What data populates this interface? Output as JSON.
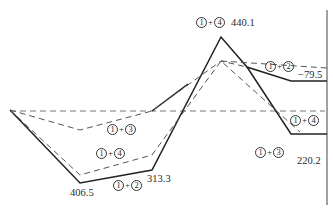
{
  "diagram": {
    "type": "moment-envelope",
    "baseline": {
      "y": 111,
      "x1": 10,
      "x2": 325,
      "style": "dashed"
    },
    "right_support_line": {
      "x": 327,
      "y1": 10,
      "y2": 205
    },
    "solid_paths": [
      {
        "name": "solid-upper",
        "points": "10,110 80,183 152,170 221,37 247,67 291,81 327,81"
      },
      {
        "name": "solid-lower",
        "points": "152,111 188,84"
      },
      {
        "name": "solid-right-drop",
        "points": "247,67 291,134 327,134"
      }
    ],
    "dashed_paths": [
      {
        "name": "dashed-combo-1-3",
        "points": "10,110 80,130 152,111 221,61 247,67"
      },
      {
        "name": "dashed-combo-1-4",
        "points": "10,110 80,175 152,155 221,61 300,132"
      },
      {
        "name": "dashed-peak-right",
        "points": "221,61 327,68"
      }
    ],
    "values": {
      "v1": "440.1",
      "v2": "−79.5",
      "v3": "406.5",
      "v4": "313.3",
      "v5": "220.2"
    },
    "combos": {
      "c14_top": {
        "a": "1",
        "b": "4"
      },
      "c12_right": {
        "a": "1",
        "b": "2"
      },
      "c13_left": {
        "a": "1",
        "b": "3"
      },
      "c14_left": {
        "a": "1",
        "b": "4"
      },
      "c12_bottom": {
        "a": "1",
        "b": "2"
      },
      "c14_right": {
        "a": "1",
        "b": "4"
      },
      "c13_right": {
        "a": "1",
        "b": "3"
      }
    }
  }
}
